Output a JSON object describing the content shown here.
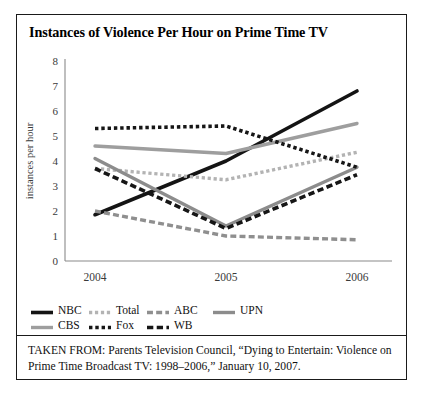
{
  "figure": {
    "title": "Instances of Violence Per Hour on Prime Time TV",
    "source_note": "TAKEN FROM: Parents Television Council, “Dying to Entertain: Violence on Prime Time Broadcast TV: 1998–2006,” January 10, 2007."
  },
  "chart_data": {
    "type": "line",
    "title": "Instances of Violence Per Hour on Prime Time TV",
    "xlabel": "",
    "ylabel": "instances per hour",
    "categories": [
      "2004",
      "2005",
      "2006"
    ],
    "x_tick_labels": [
      "2004",
      "2005",
      "2006"
    ],
    "y_tick_labels": [
      "0",
      "1",
      "2",
      "3",
      "4",
      "5",
      "6",
      "7",
      "8"
    ],
    "ylim": [
      0,
      8
    ],
    "y_tick_step": 1,
    "grid": false,
    "legend_position": "below-plot",
    "series": [
      {
        "name": "NBC",
        "values": [
          1.85,
          4.0,
          6.8
        ],
        "color": "#141414",
        "style": "solid",
        "width": 3.6
      },
      {
        "name": "Total",
        "values": [
          3.7,
          3.25,
          4.35
        ],
        "color": "#b3b3b3",
        "style": "dotted",
        "width": 3.4
      },
      {
        "name": "ABC",
        "values": [
          2.0,
          1.0,
          0.85
        ],
        "color": "#8f8f8f",
        "style": "dashed",
        "width": 3.4
      },
      {
        "name": "UPN",
        "values": [
          4.1,
          1.4,
          3.75
        ],
        "color": "#8c8c8c",
        "style": "solid",
        "width": 3.4
      },
      {
        "name": "CBS",
        "values": [
          4.6,
          4.3,
          5.5
        ],
        "color": "#9e9e9e",
        "style": "solid",
        "width": 3.4
      },
      {
        "name": "Fox",
        "values": [
          5.3,
          5.4,
          3.75
        ],
        "color": "#161616",
        "style": "dotted",
        "width": 3.6
      },
      {
        "name": "WB",
        "values": [
          3.7,
          1.3,
          3.45
        ],
        "color": "#161616",
        "style": "dashed",
        "width": 3.6
      }
    ]
  },
  "legend": {
    "rows": [
      [
        {
          "label": "NBC",
          "series": "NBC"
        },
        {
          "label": "Total",
          "series": "Total"
        },
        {
          "label": "ABC",
          "series": "ABC"
        },
        {
          "label": "UPN",
          "series": "UPN"
        }
      ],
      [
        {
          "label": "CBS",
          "series": "CBS"
        },
        {
          "label": "Fox",
          "series": "Fox"
        },
        {
          "label": "WB",
          "series": "WB"
        }
      ]
    ]
  }
}
